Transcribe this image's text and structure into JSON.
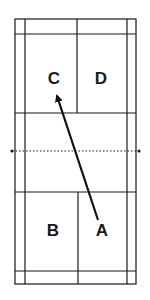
{
  "diagram": {
    "type": "badminton-court-doubles",
    "colors": {
      "lines": "#1a1a1a",
      "background": "#ffffff"
    },
    "court": {
      "outer": {
        "left": 15,
        "right": 136,
        "top": 19,
        "bottom": 284
      },
      "singles_sidelines": {
        "left": 25,
        "right": 127
      },
      "back_service_lines": {
        "top": 34,
        "bottom": 271
      },
      "short_service_lines": {
        "top": 113,
        "bottom": 192
      },
      "center_line_x": 77,
      "net": {
        "y": 151,
        "left_post_x": 12,
        "right_post_x": 139,
        "style": "dotted"
      }
    },
    "positions": [
      {
        "id": "C",
        "label": "C",
        "x": 54,
        "y": 80
      },
      {
        "id": "D",
        "label": "D",
        "x": 101,
        "y": 80
      },
      {
        "id": "B",
        "label": "B",
        "x": 53,
        "y": 232
      },
      {
        "id": "A",
        "label": "A",
        "x": 102,
        "y": 232
      }
    ],
    "arrow": {
      "from": "A",
      "to": "C",
      "x1": 98,
      "y1": 220,
      "x2": 56,
      "y2": 93
    }
  }
}
